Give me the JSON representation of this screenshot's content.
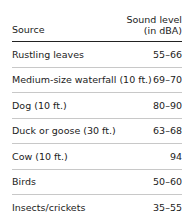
{
  "table": {
    "headers": {
      "source": "Source",
      "level_line1": "Sound level",
      "level_line2": "(in dBA)"
    },
    "rows": [
      {
        "source": "Rustling leaves",
        "level": "55–66"
      },
      {
        "source": "Medium-size waterfall (10 ft.)",
        "level": "69–70"
      },
      {
        "source": "Dog (10 ft.)",
        "level": "80–90"
      },
      {
        "source": "Duck or goose (30 ft.)",
        "level": "63–68"
      },
      {
        "source": "Cow (10 ft.)",
        "level": "94"
      },
      {
        "source": "Birds",
        "level": "50–60"
      },
      {
        "source": "Insects/crickets",
        "level": "35–55"
      }
    ]
  }
}
